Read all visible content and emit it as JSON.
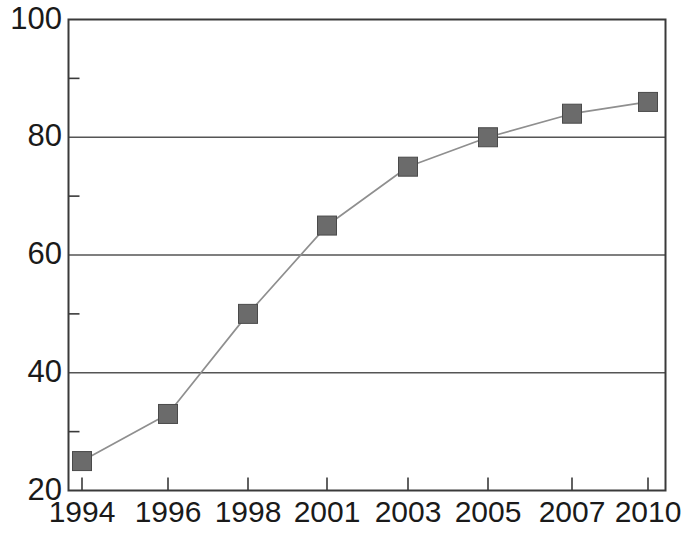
{
  "chart_data": {
    "type": "line",
    "title": "",
    "subtitle": "",
    "xlabel": "",
    "ylabel": "",
    "categories": [
      "1994",
      "1996",
      "1998",
      "2001",
      "2003",
      "2005",
      "2007",
      "2010"
    ],
    "x": [
      1994,
      1996,
      1998,
      2001,
      2003,
      2005,
      2007,
      2010
    ],
    "values": [
      25,
      33,
      50,
      65,
      75,
      80,
      84,
      86
    ],
    "series": [
      {
        "name": "",
        "values": [
          25,
          33,
          50,
          65,
          75,
          80,
          84,
          86
        ],
        "marker": "square",
        "marker_color": "#6b6b6b",
        "line_color": "#8a8a8a"
      }
    ],
    "ylim": [
      20,
      100
    ],
    "y_major_ticks": [
      20,
      40,
      60,
      80,
      100
    ],
    "y_minor_ticks": [
      30,
      50,
      70,
      90
    ],
    "y_tick_labels": [
      "20",
      "40",
      "60",
      "80",
      "100"
    ],
    "x_tick_labels": [
      "1994",
      "1996",
      "1998",
      "2001",
      "2003",
      "2005",
      "2007",
      "2010"
    ],
    "grid": "horizontal-major",
    "legend": "none",
    "annotations": []
  },
  "colors": {
    "axis": "#3a3a3a",
    "gridline": "#555555",
    "marker_fill": "#6b6b6b",
    "marker_stroke": "#4a4a4a",
    "series_line": "#8f8f8f",
    "text": "#1a1a1a",
    "background": "#ffffff"
  },
  "axes": {
    "y_labels": [
      {
        "value": 100,
        "text": "100"
      },
      {
        "value": 80,
        "text": "80"
      },
      {
        "value": 60,
        "text": "60"
      },
      {
        "value": 40,
        "text": "40"
      },
      {
        "value": 20,
        "text": "20"
      }
    ],
    "x_labels": [
      {
        "value": 1994,
        "text": "1994"
      },
      {
        "value": 1996,
        "text": "1996"
      },
      {
        "value": 1998,
        "text": "1998"
      },
      {
        "value": 2001,
        "text": "2001"
      },
      {
        "value": 2003,
        "text": "2003"
      },
      {
        "value": 2005,
        "text": "2005"
      },
      {
        "value": 2007,
        "text": "2007"
      },
      {
        "value": 2010,
        "text": "2010"
      }
    ]
  }
}
